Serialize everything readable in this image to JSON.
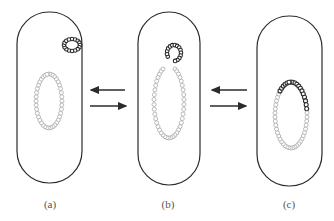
{
  "diagram": {
    "type": "plasmid-integration-schematic",
    "panels": [
      {
        "id": "a",
        "label": "(a)",
        "state": "free plasmid separate from chromosome"
      },
      {
        "id": "b",
        "label": "(b)",
        "state": "plasmid opened, joining chromosome"
      },
      {
        "id": "c",
        "label": "(c)",
        "state": "plasmid integrated into chromosome"
      }
    ],
    "transitions": [
      {
        "between": [
          "a",
          "b"
        ],
        "arrows": [
          "left",
          "right"
        ],
        "reversible": true
      },
      {
        "between": [
          "b",
          "c"
        ],
        "arrows": [
          "left",
          "right"
        ],
        "reversible": true
      }
    ],
    "colors": {
      "outline": "#2b2b2b",
      "plasmid": "#2a2a2a",
      "chromosome": "#a8a8a8",
      "background": "#ffffff"
    }
  }
}
